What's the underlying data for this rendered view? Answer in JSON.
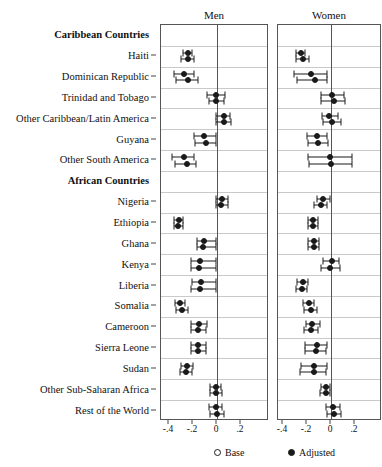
{
  "figure": {
    "panels": [
      {
        "key": "men",
        "title": "Men"
      },
      {
        "key": "women",
        "title": "Women"
      }
    ],
    "legend": [
      {
        "key": "base",
        "label": "Base",
        "marker": "hollow-circle"
      },
      {
        "key": "adjusted",
        "label": "Adjusted",
        "marker": "solid-circle"
      }
    ],
    "axis": {
      "ticks": [
        -0.4,
        -0.2,
        0,
        0.2
      ],
      "tick_labels": [
        "-.4",
        "-.2",
        "0",
        ".2"
      ],
      "xlim": [
        -0.5,
        0.3
      ],
      "zero_reference": 0
    }
  },
  "chart_data": {
    "type": "scatter",
    "title": "",
    "subtitle": "",
    "xlabel": "",
    "ylabel": "",
    "xlim": [
      -0.5,
      0.3
    ],
    "grid": true,
    "legend_position": "bottom",
    "tick_labels": [
      "-.4",
      "-.2",
      "0",
      ".2"
    ],
    "ticks": [
      -0.4,
      -0.2,
      0,
      0.2
    ],
    "series": [
      {
        "name": "Base",
        "marker": "hollow-circle"
      },
      {
        "name": "Adjusted",
        "marker": "solid-circle"
      }
    ],
    "panels": [
      "Men",
      "Women"
    ],
    "categories": [
      "Caribbean Countries",
      "Haiti",
      "Dominican Republic",
      "Trinidad and Tobago",
      "Other Caribbean/Latin America",
      "Guyana",
      "Other South America",
      "African Countries",
      "Nigeria",
      "Ethiopia",
      "Ghana",
      "Kenya",
      "Liberia",
      "Somalia",
      "Cameroon",
      "Sierra Leone",
      "Sudan",
      "Other Sub-Saharan Africa",
      "Rest of the World"
    ],
    "rows": [
      {
        "label": "Caribbean Countries",
        "header": true,
        "men": null,
        "women": null
      },
      {
        "label": "Haiti",
        "header": false,
        "men": {
          "base": {
            "est": -0.245,
            "lo": -0.285,
            "hi": -0.205
          },
          "adjusted": {
            "est": -0.245,
            "lo": -0.3,
            "hi": -0.195
          }
        },
        "women": {
          "base": {
            "est": -0.25,
            "lo": -0.295,
            "hi": -0.215
          },
          "adjusted": {
            "est": -0.23,
            "lo": -0.29,
            "hi": -0.18
          }
        }
      },
      {
        "label": "Dominican Republic",
        "header": false,
        "men": {
          "base": {
            "est": -0.275,
            "lo": -0.355,
            "hi": -0.195
          },
          "adjusted": {
            "est": -0.24,
            "lo": -0.345,
            "hi": -0.155
          }
        },
        "women": {
          "base": {
            "est": -0.165,
            "lo": -0.305,
            "hi": -0.03
          },
          "adjusted": {
            "est": -0.135,
            "lo": -0.28,
            "hi": -0.035
          }
        }
      },
      {
        "label": "Trinidad and Tobago",
        "header": false,
        "men": {
          "base": {
            "est": -0.005,
            "lo": -0.08,
            "hi": 0.065
          },
          "adjusted": {
            "est": -0.005,
            "lo": -0.07,
            "hi": 0.06
          }
        },
        "women": {
          "base": {
            "est": 0.01,
            "lo": -0.08,
            "hi": 0.11
          },
          "adjusted": {
            "est": 0.025,
            "lo": -0.08,
            "hi": 0.12
          }
        }
      },
      {
        "label": "Other Caribbean/Latin America",
        "header": false,
        "men": {
          "base": {
            "est": 0.06,
            "lo": -0.01,
            "hi": 0.11
          },
          "adjusted": {
            "est": 0.06,
            "lo": -0.01,
            "hi": 0.115
          }
        },
        "women": {
          "base": {
            "est": -0.015,
            "lo": -0.075,
            "hi": 0.06
          },
          "adjusted": {
            "est": 0.005,
            "lo": -0.07,
            "hi": 0.085
          }
        }
      },
      {
        "label": "Guyana",
        "header": false,
        "men": {
          "base": {
            "est": -0.105,
            "lo": -0.19,
            "hi": -0.005
          },
          "adjusted": {
            "est": -0.09,
            "lo": -0.185,
            "hi": -0.005
          }
        },
        "women": {
          "base": {
            "est": -0.12,
            "lo": -0.2,
            "hi": -0.035
          },
          "adjusted": {
            "est": -0.105,
            "lo": -0.195,
            "hi": -0.025
          }
        }
      },
      {
        "label": "Other South America",
        "header": false,
        "men": {
          "base": {
            "est": -0.275,
            "lo": -0.375,
            "hi": -0.195
          },
          "adjusted": {
            "est": -0.25,
            "lo": -0.35,
            "hi": -0.175
          }
        },
        "women": {
          "base": {
            "est": -0.005,
            "lo": -0.19,
            "hi": 0.175
          },
          "adjusted": {
            "est": 0.0,
            "lo": -0.185,
            "hi": 0.175
          }
        }
      },
      {
        "label": "African Countries",
        "header": true,
        "men": null,
        "women": null
      },
      {
        "label": "Nigeria",
        "header": false,
        "men": {
          "base": {
            "est": 0.04,
            "lo": -0.005,
            "hi": 0.095
          },
          "adjusted": {
            "est": 0.03,
            "lo": -0.01,
            "hi": 0.09
          }
        },
        "women": {
          "base": {
            "est": -0.065,
            "lo": -0.12,
            "hi": -0.01
          },
          "adjusted": {
            "est": -0.085,
            "lo": -0.145,
            "hi": -0.03
          }
        }
      },
      {
        "label": "Ethiopia",
        "header": false,
        "men": {
          "base": {
            "est": -0.32,
            "lo": -0.355,
            "hi": -0.28
          },
          "adjusted": {
            "est": -0.325,
            "lo": -0.36,
            "hi": -0.285
          }
        },
        "women": {
          "base": {
            "est": -0.15,
            "lo": -0.195,
            "hi": -0.11
          },
          "adjusted": {
            "est": -0.15,
            "lo": -0.195,
            "hi": -0.11
          }
        }
      },
      {
        "label": "Ghana",
        "header": false,
        "men": {
          "base": {
            "est": -0.11,
            "lo": -0.165,
            "hi": -0.005
          },
          "adjusted": {
            "est": -0.115,
            "lo": -0.17,
            "hi": -0.005
          }
        },
        "women": {
          "base": {
            "est": -0.145,
            "lo": -0.19,
            "hi": -0.1
          },
          "adjusted": {
            "est": -0.145,
            "lo": -0.195,
            "hi": -0.1
          }
        }
      },
      {
        "label": "Kenya",
        "header": false,
        "men": {
          "base": {
            "est": -0.14,
            "lo": -0.215,
            "hi": -0.005
          },
          "adjusted": {
            "est": -0.15,
            "lo": -0.22,
            "hi": -0.005
          }
        },
        "women": {
          "base": {
            "est": 0.005,
            "lo": -0.065,
            "hi": 0.07
          },
          "adjusted": {
            "est": -0.01,
            "lo": -0.08,
            "hi": 0.075
          }
        }
      },
      {
        "label": "Liberia",
        "header": false,
        "men": {
          "base": {
            "est": -0.135,
            "lo": -0.21,
            "hi": -0.005
          },
          "adjusted": {
            "est": -0.145,
            "lo": -0.215,
            "hi": -0.005
          }
        },
        "women": {
          "base": {
            "est": -0.235,
            "lo": -0.285,
            "hi": -0.195
          },
          "adjusted": {
            "est": -0.245,
            "lo": -0.29,
            "hi": -0.2
          }
        }
      },
      {
        "label": "Somalia",
        "header": false,
        "men": {
          "base": {
            "est": -0.305,
            "lo": -0.35,
            "hi": -0.265
          },
          "adjusted": {
            "est": -0.29,
            "lo": -0.345,
            "hi": -0.245
          }
        },
        "women": {
          "base": {
            "est": -0.185,
            "lo": -0.235,
            "hi": -0.14
          },
          "adjusted": {
            "est": -0.165,
            "lo": -0.225,
            "hi": -0.12
          }
        }
      },
      {
        "label": "Cameroon",
        "header": false,
        "men": {
          "base": {
            "est": -0.15,
            "lo": -0.215,
            "hi": -0.085
          },
          "adjusted": {
            "est": -0.16,
            "lo": -0.22,
            "hi": -0.095
          }
        },
        "women": {
          "base": {
            "est": -0.155,
            "lo": -0.21,
            "hi": -0.095
          },
          "adjusted": {
            "est": -0.17,
            "lo": -0.225,
            "hi": -0.11
          }
        }
      },
      {
        "label": "Sierra Leone",
        "header": false,
        "men": {
          "base": {
            "est": -0.155,
            "lo": -0.215,
            "hi": -0.09
          },
          "adjusted": {
            "est": -0.16,
            "lo": -0.22,
            "hi": -0.095
          }
        },
        "women": {
          "base": {
            "est": -0.12,
            "lo": -0.215,
            "hi": -0.035
          },
          "adjusted": {
            "est": -0.125,
            "lo": -0.22,
            "hi": -0.04
          }
        }
      },
      {
        "label": "Sudan",
        "header": false,
        "men": {
          "base": {
            "est": -0.25,
            "lo": -0.3,
            "hi": -0.2
          },
          "adjusted": {
            "est": -0.255,
            "lo": -0.305,
            "hi": -0.205
          }
        },
        "women": {
          "base": {
            "est": -0.14,
            "lo": -0.25,
            "hi": -0.035
          },
          "adjusted": {
            "est": -0.145,
            "lo": -0.255,
            "hi": -0.04
          }
        }
      },
      {
        "label": "Other Sub-Saharan Africa",
        "header": false,
        "men": {
          "base": {
            "est": -0.01,
            "lo": -0.055,
            "hi": 0.035
          },
          "adjusted": {
            "est": -0.01,
            "lo": -0.055,
            "hi": 0.04
          }
        },
        "women": {
          "base": {
            "est": -0.045,
            "lo": -0.085,
            "hi": -0.005
          },
          "adjusted": {
            "est": -0.045,
            "lo": -0.09,
            "hi": -0.005
          }
        }
      },
      {
        "label": "Rest of the World",
        "header": false,
        "men": {
          "base": {
            "est": -0.01,
            "lo": -0.065,
            "hi": 0.045
          },
          "adjusted": {
            "est": 0.0,
            "lo": -0.06,
            "hi": 0.055
          }
        },
        "women": {
          "base": {
            "est": 0.015,
            "lo": -0.04,
            "hi": 0.075
          },
          "adjusted": {
            "est": 0.025,
            "lo": -0.035,
            "hi": 0.085
          }
        }
      }
    ]
  }
}
